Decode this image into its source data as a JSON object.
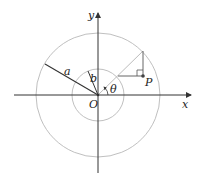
{
  "diagram": {
    "labels": {
      "y_axis": "y",
      "x_axis": "x",
      "origin": "O",
      "outer_radius": "a",
      "inner_radius": "b",
      "angle": "θ",
      "point": "P"
    },
    "colors": {
      "axis": "#333333",
      "circle": "#b8b8b8",
      "construction": "#999999",
      "radius_line": "#333333",
      "background": "#ffffff"
    }
  }
}
